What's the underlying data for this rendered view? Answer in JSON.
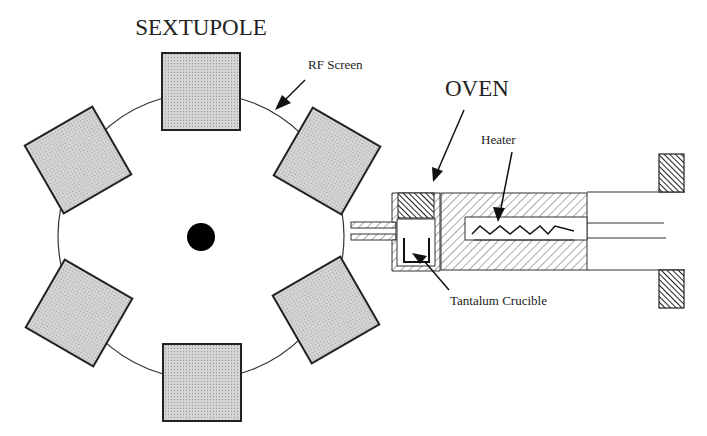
{
  "diagram": {
    "title": "SEXTUPOLE",
    "oven_label": "OVEN",
    "labels": {
      "rf_screen": "RF Screen",
      "heater": "Heater",
      "crucible": "Tantalum Crucible"
    },
    "components": [
      {
        "name": "sextupole",
        "poles": 6,
        "pole_fill": "#d0d0d0"
      },
      {
        "name": "rf-screen",
        "shape": "circle"
      },
      {
        "name": "beam-axis",
        "shape": "filled-dot",
        "color": "#000000"
      },
      {
        "name": "oven",
        "parts": [
          "crucible",
          "heater",
          "hatched-housing",
          "nozzle",
          "end-flanges"
        ]
      }
    ]
  }
}
